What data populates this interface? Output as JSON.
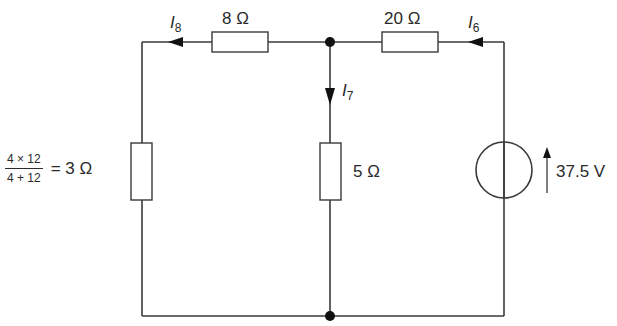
{
  "diagram": {
    "type": "circuit",
    "resistors": [
      {
        "id": "R_top_left",
        "label": "8 Ω"
      },
      {
        "id": "R_top_right",
        "label": "20 Ω"
      },
      {
        "id": "R_middle",
        "label": "5 Ω"
      },
      {
        "id": "R_left",
        "label": "3 Ω",
        "expression": {
          "numerator": "4 × 12",
          "denominator": "4 + 12",
          "result": "= 3 Ω"
        }
      }
    ],
    "source": {
      "label": "37.5 V",
      "direction": "up"
    },
    "currents": [
      {
        "name": "I",
        "sub": "8",
        "direction": "left"
      },
      {
        "name": "I",
        "sub": "7",
        "direction": "down"
      },
      {
        "name": "I",
        "sub": "6",
        "direction": "left"
      }
    ],
    "colors": {
      "line": "#3a3a3a",
      "text": "#2a2a2a",
      "background": "#ffffff"
    }
  }
}
